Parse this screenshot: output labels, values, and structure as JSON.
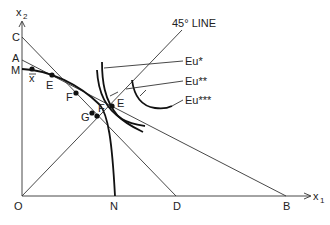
{
  "axes": {
    "x_label": "x",
    "x_sub": "1",
    "y_label": "x",
    "y_sub": "2",
    "origin": "O"
  },
  "points": {
    "C": "C",
    "A": "A",
    "M": "M",
    "xbar": "x",
    "E": "E",
    "F": "F",
    "G": "G",
    "Fprime": "F",
    "Eprime": "E",
    "N": "N",
    "D": "D",
    "B": "B"
  },
  "annotations": {
    "line45": "45° LINE",
    "eu1": "Eu*",
    "eu2": "Eu**",
    "eu3": "Eu***"
  }
}
